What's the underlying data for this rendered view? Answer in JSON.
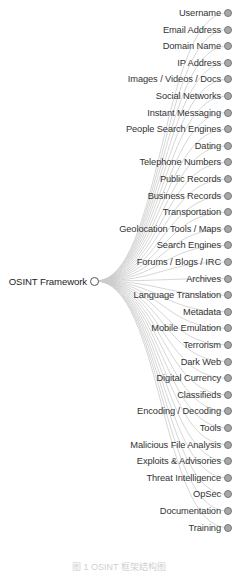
{
  "tree": {
    "root": {
      "label": "OSINT Framework",
      "expanded": true
    },
    "children": [
      {
        "label": "Username"
      },
      {
        "label": "Email Address"
      },
      {
        "label": "Domain Name"
      },
      {
        "label": "IP Address"
      },
      {
        "label": "Images / Videos / Docs"
      },
      {
        "label": "Social Networks"
      },
      {
        "label": "Instant Messaging"
      },
      {
        "label": "People Search Engines"
      },
      {
        "label": "Dating"
      },
      {
        "label": "Telephone Numbers"
      },
      {
        "label": "Public Records"
      },
      {
        "label": "Business Records"
      },
      {
        "label": "Transportation"
      },
      {
        "label": "Geolocation Tools / Maps"
      },
      {
        "label": "Search Engines"
      },
      {
        "label": "Forums / Blogs / IRC"
      },
      {
        "label": "Archives"
      },
      {
        "label": "Language Translation"
      },
      {
        "label": "Metadata"
      },
      {
        "label": "Mobile Emulation"
      },
      {
        "label": "Terrorism"
      },
      {
        "label": "Dark Web"
      },
      {
        "label": "Digital Currency"
      },
      {
        "label": "Classifieds"
      },
      {
        "label": "Encoding / Decoding"
      },
      {
        "label": "Tools"
      },
      {
        "label": "Malicious File Analysis"
      },
      {
        "label": "Exploits & Advisories"
      },
      {
        "label": "Threat Intelligence"
      },
      {
        "label": "OpSec"
      },
      {
        "label": "Documentation"
      },
      {
        "label": "Training"
      }
    ]
  },
  "colors": {
    "link": "#cccccc",
    "collapsed_node_fill": "#a8a8a8",
    "node_stroke": "#7a7a7a",
    "root_fill": "#ffffff"
  },
  "caption": "图 1  OSINT 框架结构图"
}
